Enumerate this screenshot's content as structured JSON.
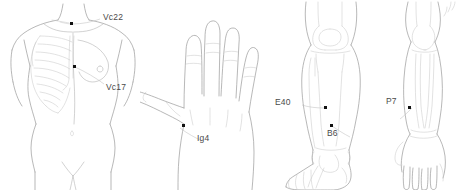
{
  "figure": {
    "background_color": "#ffffff",
    "line_color": "#9a9a9a",
    "marker_color": "#111111",
    "label_color": "#4a4a4a"
  },
  "panels": [
    {
      "id": "torso",
      "name": "anterior-torso",
      "points": [
        {
          "code": "Vc22",
          "name": "point-vc22"
        },
        {
          "code": "Vc17",
          "name": "point-vc17"
        }
      ]
    },
    {
      "id": "hand",
      "name": "dorsal-hand",
      "points": [
        {
          "code": "Ig4",
          "name": "point-ig4"
        }
      ]
    },
    {
      "id": "leg",
      "name": "lower-leg",
      "points": [
        {
          "code": "E40",
          "name": "point-e40"
        },
        {
          "code": "B6",
          "name": "point-b6"
        }
      ]
    },
    {
      "id": "arm",
      "name": "forearm",
      "points": [
        {
          "code": "P7",
          "name": "point-p7"
        }
      ]
    }
  ]
}
